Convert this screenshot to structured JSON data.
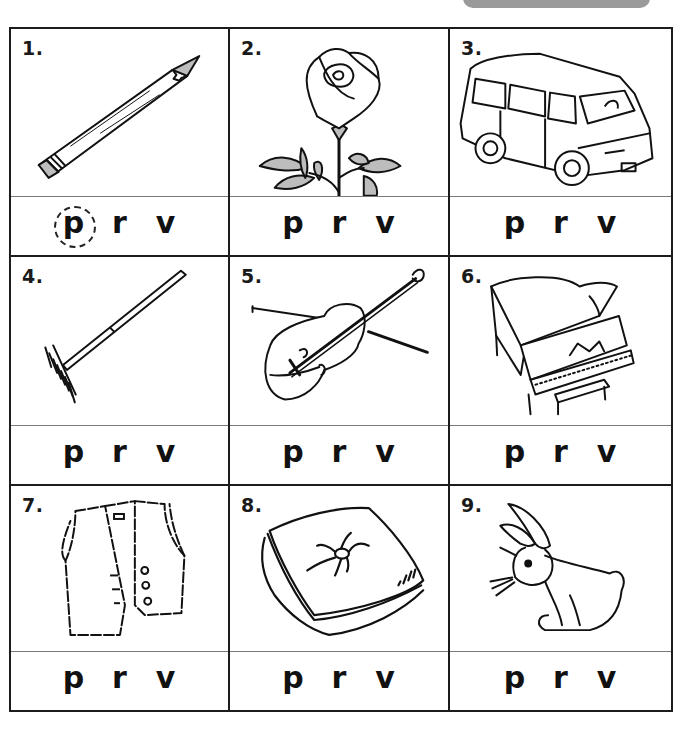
{
  "worksheet": {
    "instructions_tab_color": "#9a9a9a",
    "letter_choices": [
      "p",
      "r",
      "v"
    ],
    "items": [
      {
        "number": "1.",
        "picture": "pencil",
        "choices": [
          "p",
          "r",
          "v"
        ],
        "circled": "p"
      },
      {
        "number": "2.",
        "picture": "rose",
        "choices": [
          "p",
          "r",
          "v"
        ],
        "circled": null
      },
      {
        "number": "3.",
        "picture": "van",
        "choices": [
          "p",
          "r",
          "v"
        ],
        "circled": null
      },
      {
        "number": "4.",
        "picture": "rake",
        "choices": [
          "p",
          "r",
          "v"
        ],
        "circled": null
      },
      {
        "number": "5.",
        "picture": "violin",
        "choices": [
          "p",
          "r",
          "v"
        ],
        "circled": null
      },
      {
        "number": "6.",
        "picture": "piano",
        "choices": [
          "p",
          "r",
          "v"
        ],
        "circled": null
      },
      {
        "number": "7.",
        "picture": "vest",
        "choices": [
          "p",
          "r",
          "v"
        ],
        "circled": null
      },
      {
        "number": "8.",
        "picture": "pillow",
        "choices": [
          "p",
          "r",
          "v"
        ],
        "circled": null
      },
      {
        "number": "9.",
        "picture": "rabbit",
        "choices": [
          "p",
          "r",
          "v"
        ],
        "circled": null
      }
    ]
  }
}
